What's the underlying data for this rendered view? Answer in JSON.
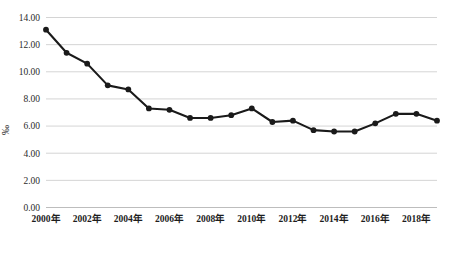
{
  "chart_data": {
    "type": "line",
    "title": "",
    "subtitle": "",
    "xlabel": "",
    "ylabel": "‰",
    "ylim": [
      0.0,
      14.0
    ],
    "yticks": [
      "0.00",
      "2.00",
      "4.00",
      "6.00",
      "8.00",
      "10.00",
      "12.00",
      "14.00"
    ],
    "ytick_values": [
      0.0,
      2.0,
      4.0,
      6.0,
      8.0,
      10.0,
      12.0,
      14.0
    ],
    "grid": true,
    "legend": "none",
    "marker": "circle",
    "line_color": "#1a1a1a",
    "grid_color": "#c9c9c9",
    "x": [
      2000,
      2001,
      2002,
      2003,
      2004,
      2005,
      2006,
      2007,
      2008,
      2009,
      2010,
      2011,
      2012,
      2013,
      2014,
      2015,
      2016,
      2017,
      2018,
      2019
    ],
    "xtick_labels": [
      "2000年",
      "2002年",
      "2004年",
      "2006年",
      "2008年",
      "2010年",
      "2012年",
      "2014年",
      "2016年",
      "2018年"
    ],
    "xtick_values": [
      2000,
      2002,
      2004,
      2006,
      2008,
      2010,
      2012,
      2014,
      2016,
      2018
    ],
    "values": [
      13.1,
      11.4,
      10.6,
      9.0,
      8.7,
      7.3,
      7.2,
      6.6,
      6.6,
      6.8,
      7.3,
      6.3,
      6.4,
      5.7,
      5.6,
      5.6,
      6.2,
      6.9,
      6.9,
      6.4
    ],
    "series": [
      {
        "name": "出生率",
        "values": [
          13.1,
          11.4,
          10.6,
          9.0,
          8.7,
          7.3,
          7.2,
          6.6,
          6.6,
          6.8,
          7.3,
          6.3,
          6.4,
          5.7,
          5.6,
          5.6,
          6.2,
          6.9,
          6.9,
          6.4
        ]
      }
    ]
  }
}
